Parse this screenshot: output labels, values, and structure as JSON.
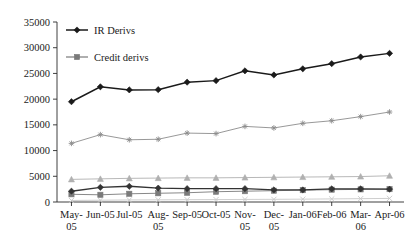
{
  "chart_data": {
    "type": "line",
    "title": "",
    "xlabel": "",
    "ylabel": "",
    "ylim": [
      0,
      35000
    ],
    "ytick_step": 5000,
    "grid": false,
    "legend_position": "top-left-inside",
    "categories": [
      "May-05",
      "Jun-05",
      "Jul-05",
      "Aug-05",
      "Sep-05",
      "Oct-05",
      "Nov-05",
      "Dec-05",
      "Jan-06",
      "Feb-06",
      "Mar-06",
      "Apr-06"
    ],
    "ytick_labels": [
      "0",
      "5000",
      "10000",
      "15000",
      "20000",
      "25000",
      "30000",
      "35000"
    ],
    "ytick_values": [
      0,
      5000,
      10000,
      15000,
      20000,
      25000,
      30000,
      35000
    ],
    "series": [
      {
        "name": "IR Derivs",
        "marker": "diamond",
        "color": "#1a1a1a",
        "in_legend": true,
        "values": [
          19500,
          22400,
          21800,
          21850,
          23300,
          23600,
          25500,
          24700,
          25900,
          26900,
          28200,
          28900
        ]
      },
      {
        "name": "Credit derivs",
        "marker": "square",
        "color": "#7a7a7a",
        "in_legend": true,
        "values": [
          1500,
          1400,
          1600,
          1700,
          1800,
          2000,
          2100,
          2200,
          2300,
          2400,
          2450,
          2500
        ]
      },
      {
        "name": "",
        "marker": "asterisk",
        "color": "#8c8c8c",
        "in_legend": false,
        "values": [
          11400,
          13100,
          12100,
          12200,
          13400,
          13300,
          14700,
          14400,
          15300,
          15800,
          16600,
          17500
        ]
      },
      {
        "name": "",
        "marker": "triangle",
        "color": "#b0b0b0",
        "in_legend": false,
        "values": [
          4400,
          4500,
          4600,
          4650,
          4700,
          4700,
          4750,
          4800,
          4850,
          4900,
          4950,
          5100
        ]
      },
      {
        "name": "",
        "marker": "diamond",
        "color": "#333333",
        "in_legend": false,
        "values": [
          2100,
          2850,
          3050,
          2700,
          2600,
          2600,
          2600,
          2350,
          2350,
          2550,
          2550,
          2500
        ]
      },
      {
        "name": "",
        "marker": "cross",
        "color": "#c8c8c8",
        "in_legend": false,
        "values": [
          300,
          350,
          400,
          420,
          450,
          470,
          500,
          520,
          550,
          600,
          650,
          700
        ]
      }
    ]
  },
  "legend": {
    "items": [
      {
        "label": "IR Derivs",
        "marker": "diamond",
        "color": "#1a1a1a"
      },
      {
        "label": "Credit derivs",
        "marker": "square",
        "color": "#7a7a7a"
      }
    ]
  }
}
